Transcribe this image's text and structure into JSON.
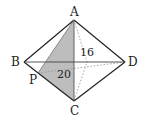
{
  "diagram": {
    "type": "octahedron-like solid (square bipyramid) with shaded cross-section",
    "vertices": {
      "A": {
        "label": "A",
        "x": 74,
        "y": 20
      },
      "B": {
        "label": "B",
        "x": 24,
        "y": 62
      },
      "C": {
        "label": "C",
        "x": 74,
        "y": 101
      },
      "D": {
        "label": "D",
        "x": 125,
        "y": 62
      },
      "P": {
        "label": "P",
        "x": 38,
        "y": 73
      }
    },
    "hidden_vertex": {
      "x": 87,
      "y": 62
    },
    "measurements": {
      "height_label": "16",
      "diagonal_label": "20"
    },
    "shaded_region": "triangle APC",
    "colors": {
      "stroke": "#222222",
      "shade": "#bdbdbd",
      "dotted": "#999999"
    }
  }
}
